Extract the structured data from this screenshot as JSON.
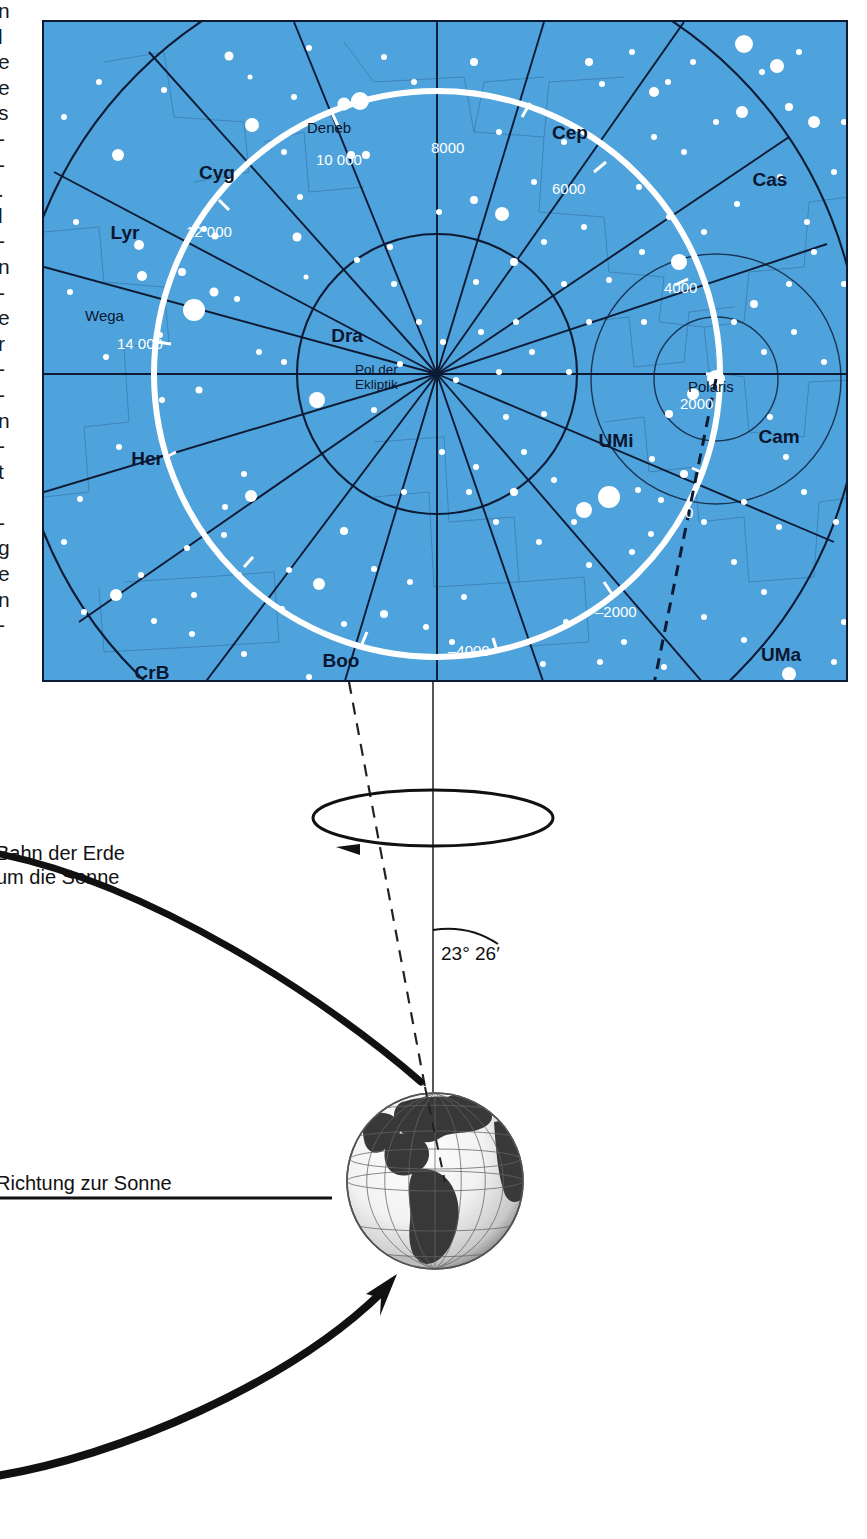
{
  "edge_column": {
    "note": "partial cut-off letters from adjacent text column",
    "chars": [
      "n",
      "l",
      "e",
      "e",
      "s",
      "-",
      "-",
      ".",
      "l",
      "-",
      "n",
      "-",
      "e",
      "r",
      "-",
      "-",
      "n",
      "-",
      "t",
      "",
      "-",
      "g",
      "e",
      "n",
      "-"
    ]
  },
  "star_chart": {
    "background_color": "#4fa3dc",
    "grid_color": "#0d1a33",
    "precession_circle_color": "#ffffff",
    "constellations": [
      {
        "abbr": "Cyg",
        "x": 215,
        "y": 150
      },
      {
        "abbr": "Lyr",
        "x": 120,
        "y": 210
      },
      {
        "abbr": "Cep",
        "x": 568,
        "y": 110
      },
      {
        "abbr": "Cas",
        "x": 768,
        "y": 157
      },
      {
        "abbr": "Dra",
        "x": 345,
        "y": 313
      },
      {
        "abbr": "Her",
        "x": 145,
        "y": 436
      },
      {
        "abbr": "UMi",
        "x": 614,
        "y": 418
      },
      {
        "abbr": "Cam",
        "x": 777,
        "y": 414
      },
      {
        "abbr": "CrB",
        "x": 150,
        "y": 650
      },
      {
        "abbr": "Boo",
        "x": 339,
        "y": 638
      },
      {
        "abbr": "UMa",
        "x": 779,
        "y": 632
      }
    ],
    "star_names": [
      {
        "name": "Deneb",
        "x": 331,
        "y": 104
      },
      {
        "name": "Wega",
        "x": 104,
        "y": 292
      },
      {
        "name": "Polaris",
        "x": 712,
        "y": 363
      }
    ],
    "pole_label": {
      "line1": "Pol der",
      "line2": "Ekliptik",
      "x": 367,
      "y": 367
    },
    "precession_years": [
      {
        "label": "10 000",
        "x": 345,
        "y": 137
      },
      {
        "label": "8000",
        "x": 455,
        "y": 125
      },
      {
        "label": "6000",
        "x": 576,
        "y": 166
      },
      {
        "label": "12 000",
        "x": 210,
        "y": 209
      },
      {
        "label": "4000",
        "x": 660,
        "y": 265
      },
      {
        "label": "14 000",
        "x": 141,
        "y": 321
      },
      {
        "label": "2000",
        "x": 697,
        "y": 379
      },
      {
        "label": "0",
        "x": 651,
        "y": 489
      },
      {
        "label": "–2000",
        "x": 599,
        "y": 588
      },
      {
        "label": "–4000",
        "x": 459,
        "y": 626
      }
    ]
  },
  "lower_diagram": {
    "orbit_label": {
      "line1": "Bahn der Erde",
      "line2": "um die Sonne"
    },
    "sun_direction_label": "Richtung zur Sonne",
    "obliquity_label": "23° 26′",
    "rotation_arrow_direction": "counter-clockwise",
    "earth_globe": "earth-globe-americas"
  }
}
